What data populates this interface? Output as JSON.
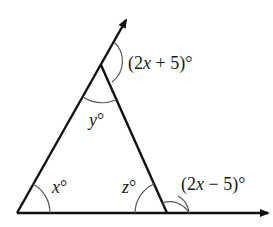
{
  "diagram": {
    "type": "triangle-exterior-angles",
    "labels": {
      "top_exterior": {
        "open": "(2",
        "var": "x",
        "rest": " + 5)°"
      },
      "apex_interior": {
        "var": "y",
        "deg": "°"
      },
      "left_interior": {
        "var": "x",
        "deg": "°"
      },
      "right_interior": {
        "var": "z",
        "deg": "°"
      },
      "right_exterior": {
        "open": "(2",
        "var": "x",
        "rest": " − 5)°"
      }
    },
    "colors": {
      "line": "#111111",
      "arc": "#555555",
      "text": "#1a1a1a"
    }
  }
}
